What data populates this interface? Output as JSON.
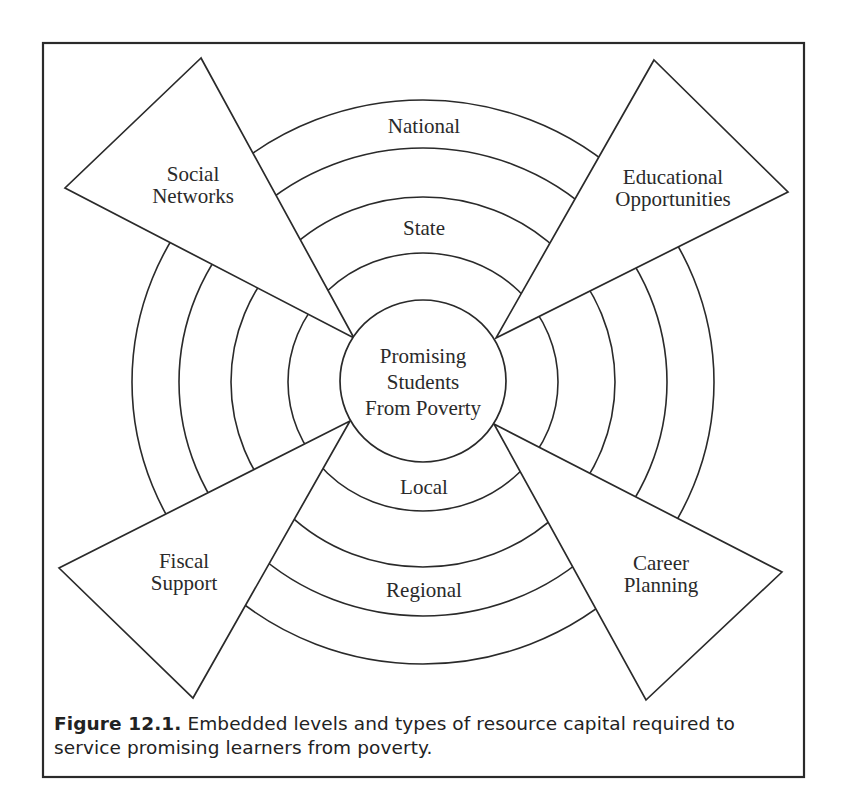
{
  "figure": {
    "center": {
      "label_lines": [
        "Promising",
        "Students",
        "From Poverty"
      ]
    },
    "levels": [
      {
        "name": "Local",
        "label": "Local"
      },
      {
        "name": "Regional",
        "label": "Regional"
      },
      {
        "name": "State",
        "label": "State"
      },
      {
        "name": "National",
        "label": "National"
      }
    ],
    "resource_types": [
      {
        "id": "social-networks",
        "label_lines": [
          "Social",
          "Networks"
        ]
      },
      {
        "id": "educational-opportunities",
        "label_lines": [
          "Educational",
          "Opportunities"
        ]
      },
      {
        "id": "fiscal-support",
        "label_lines": [
          "Fiscal",
          "Support"
        ]
      },
      {
        "id": "career-planning",
        "label_lines": [
          "Career",
          "Planning"
        ]
      }
    ]
  },
  "caption": {
    "number": "Figure 12.1.",
    "text": "Embedded levels and types of resource capital required to service promising learners from poverty."
  },
  "colors": {
    "stroke": "#2a2a2a",
    "background": "#ffffff"
  }
}
